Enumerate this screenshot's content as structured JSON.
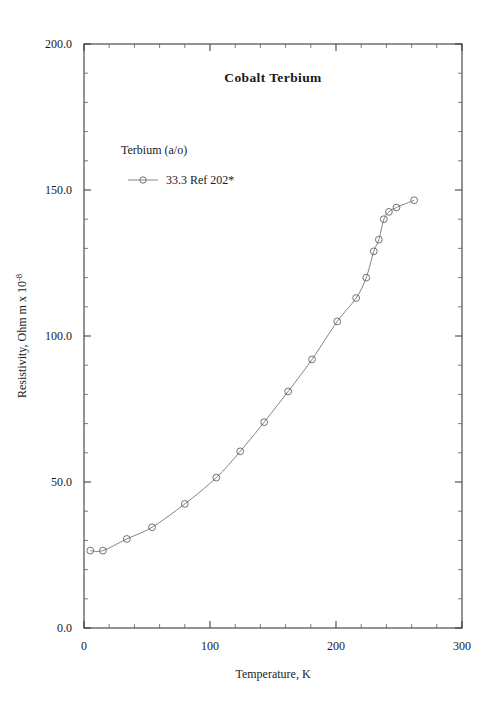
{
  "chart_data": {
    "type": "line",
    "title": "Cobalt Terbium",
    "xlabel": "Temperature,  K",
    "ylabel_main": "Resistivity, Ohm m x 10",
    "ylabel_exponent": "-8",
    "xlim": [
      0,
      300
    ],
    "ylim": [
      0,
      200
    ],
    "x_ticks": [
      0,
      100,
      200,
      300
    ],
    "x_tick_labels": [
      "0",
      "100",
      "200",
      "300"
    ],
    "y_ticks": [
      0,
      50,
      100,
      150,
      200
    ],
    "y_tick_labels": [
      "0.0",
      "50.0",
      "100.0",
      "150.0",
      "200.0"
    ],
    "x_minor_step": 20,
    "y_minor_step": 10,
    "grid": false,
    "legend_position": "upper-left-inside",
    "legend_title": "Terbium (a/o)",
    "series": [
      {
        "name": "33.3 Ref 202*",
        "marker": "open-circle",
        "color": "#5a5a5a",
        "x": [
          5,
          15,
          34,
          54,
          80,
          105,
          124,
          143,
          162,
          181,
          201,
          216,
          224,
          230,
          234,
          238,
          242,
          248,
          262
        ],
        "y": [
          26.5,
          26.5,
          30.5,
          34.5,
          42.5,
          51.5,
          60.5,
          70.5,
          81.0,
          92.0,
          105.0,
          113.0,
          120.0,
          129.0,
          133.0,
          140.0,
          142.5,
          144.0,
          146.5
        ]
      }
    ]
  }
}
